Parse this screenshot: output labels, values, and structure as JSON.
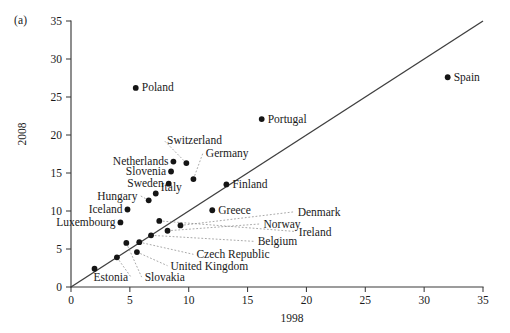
{
  "figure": {
    "panel_label": "(a)",
    "background_color": "#ffffff",
    "point_color": "#151515",
    "line_color": "#3f3f3f",
    "leader_color": "#8c8c8c"
  },
  "chart_data": {
    "type": "scatter",
    "title": "",
    "xlabel": "1998",
    "ylabel": "2008",
    "xlim": [
      0,
      35
    ],
    "ylim": [
      0,
      35
    ],
    "xticks": [
      0,
      5,
      10,
      15,
      20,
      25,
      30,
      35
    ],
    "yticks": [
      0,
      5,
      10,
      15,
      20,
      25,
      30,
      35
    ],
    "grid": false,
    "legend": "none",
    "reference_line": {
      "description": "45-degree identity line",
      "from": [
        0,
        0
      ],
      "to": [
        35,
        35
      ]
    },
    "points": [
      {
        "name": "Poland",
        "x": 5.5,
        "y": 26.2,
        "label_dx": 6,
        "label_dy": 3.6,
        "anchor": "start",
        "leader": false
      },
      {
        "name": "Spain",
        "x": 32.0,
        "y": 27.6,
        "label_dx": 6,
        "label_dy": 3.6,
        "anchor": "start",
        "leader": false
      },
      {
        "name": "Portugal",
        "x": 16.2,
        "y": 22.1,
        "label_dx": 6,
        "label_dy": 3.6,
        "anchor": "start",
        "leader": false
      },
      {
        "name": "Switzerland",
        "x": 9.8,
        "y": 16.3,
        "label_dx": 0,
        "label_dy": 0,
        "anchor": "start",
        "leader": true,
        "label_x": 7.9,
        "label_y": 19.3
      },
      {
        "name": "Germany",
        "x": 10.4,
        "y": 14.2,
        "label_dx": 0,
        "label_dy": 0,
        "anchor": "start",
        "leader": true,
        "label_x": 11.2,
        "label_y": 17.6
      },
      {
        "name": "Netherlands",
        "x": 8.7,
        "y": 16.5,
        "label_dx": -5,
        "label_dy": 3.6,
        "anchor": "end",
        "leader": false
      },
      {
        "name": "Slovenia",
        "x": 8.5,
        "y": 15.2,
        "label_dx": -5,
        "label_dy": 3.6,
        "anchor": "end",
        "leader": false
      },
      {
        "name": "Sweden",
        "x": 8.3,
        "y": 13.6,
        "label_dx": -5,
        "label_dy": 3.6,
        "anchor": "end",
        "leader": false
      },
      {
        "name": "Italy",
        "x": 7.2,
        "y": 12.3,
        "label_dx": 5,
        "label_dy": -2.4,
        "anchor": "start",
        "leader": false
      },
      {
        "name": "Finland",
        "x": 13.2,
        "y": 13.5,
        "label_dx": 6,
        "label_dy": 3.6,
        "anchor": "start",
        "leader": false
      },
      {
        "name": "Greece",
        "x": 12.0,
        "y": 10.1,
        "label_dx": 6,
        "label_dy": 3.6,
        "anchor": "start",
        "leader": false
      },
      {
        "name": "Hungary",
        "x": 6.6,
        "y": 11.4,
        "label_dx": 0,
        "label_dy": 0,
        "anchor": "end",
        "leader": true,
        "label_x": 5.9,
        "label_y": 12.0
      },
      {
        "name": "Iceland",
        "x": 4.8,
        "y": 10.2,
        "label_dx": -5,
        "label_dy": 3.6,
        "anchor": "end",
        "leader": false
      },
      {
        "name": "Luxembourg",
        "x": 4.2,
        "y": 8.5,
        "label_dx": -5,
        "label_dy": 3.6,
        "anchor": "end",
        "leader": false
      },
      {
        "name": "Denmark",
        "x": 9.3,
        "y": 8.1,
        "label_dx": 0,
        "label_dy": 0,
        "anchor": "start",
        "leader": true,
        "label_x": 19.0,
        "label_y": 9.9
      },
      {
        "name": "Norway",
        "x": 8.2,
        "y": 7.4,
        "label_dx": 0,
        "label_dy": 0,
        "anchor": "start",
        "leader": true,
        "label_x": 16.1,
        "label_y": 8.3
      },
      {
        "name": "Ireland",
        "x": 7.5,
        "y": 8.7,
        "label_dx": 0,
        "label_dy": 0,
        "anchor": "start",
        "leader": true,
        "label_x": 19.1,
        "label_y": 7.3
      },
      {
        "name": "Belgium",
        "x": 6.8,
        "y": 6.8,
        "label_dx": 0,
        "label_dy": 0,
        "anchor": "start",
        "leader": true,
        "label_x": 15.6,
        "label_y": 6.0
      },
      {
        "name": "Czech Republic",
        "x": 5.8,
        "y": 5.9,
        "label_dx": 0,
        "label_dy": 0,
        "anchor": "start",
        "leader": true,
        "label_x": 10.4,
        "label_y": 4.3
      },
      {
        "name": "United Kingdom",
        "x": 5.6,
        "y": 4.6,
        "label_dx": 0,
        "label_dy": 0,
        "anchor": "start",
        "leader": true,
        "label_x": 8.2,
        "label_y": 2.8
      },
      {
        "name": "Slovakia",
        "x": 4.7,
        "y": 5.8,
        "label_dx": 0,
        "label_dy": 0,
        "anchor": "start",
        "leader": true,
        "label_x": 6.0,
        "label_y": 1.3
      },
      {
        "name": "Estonia",
        "x": 3.9,
        "y": 3.9,
        "label_dx": 0,
        "label_dy": 0,
        "anchor": "end",
        "leader": true,
        "label_x": 5.1,
        "label_y": 1.3
      },
      {
        "name": "Unlabeled_1",
        "x": 2.0,
        "y": 2.4,
        "label_dx": 0,
        "label_dy": 0,
        "anchor": "start",
        "leader": false,
        "hide_label": true
      }
    ]
  }
}
